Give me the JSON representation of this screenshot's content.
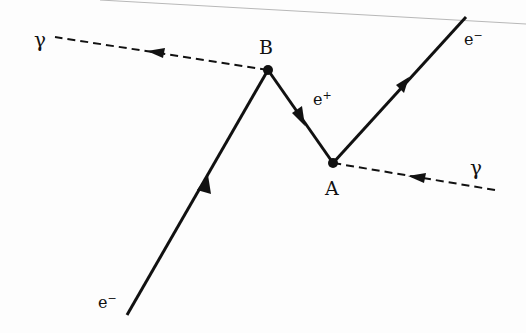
{
  "diagram": {
    "type": "feynman-diagram",
    "vertices": [
      {
        "id": "B",
        "label": "B",
        "x": 268,
        "y": 70
      },
      {
        "id": "A",
        "label": "A",
        "x": 333,
        "y": 163
      }
    ],
    "lines": [
      {
        "id": "photon-out",
        "kind": "photon",
        "from": [
          268,
          70
        ],
        "to": [
          55,
          37
        ],
        "label": "γ"
      },
      {
        "id": "electron-in",
        "kind": "fermion",
        "from": [
          127,
          315
        ],
        "to": [
          268,
          70
        ],
        "label": "e",
        "label_sup": "−"
      },
      {
        "id": "positron",
        "kind": "fermion",
        "from": [
          268,
          70
        ],
        "to": [
          333,
          163
        ],
        "label": "e",
        "label_sup": "+"
      },
      {
        "id": "electron-out",
        "kind": "fermion",
        "from": [
          333,
          163
        ],
        "to": [
          466,
          17
        ],
        "label": "e",
        "label_sup": "−"
      },
      {
        "id": "photon-in",
        "kind": "photon",
        "from": [
          495,
          190
        ],
        "to": [
          333,
          163
        ],
        "label": "γ"
      }
    ],
    "colors": {
      "line": "#111111",
      "border": "#b0b0b0"
    }
  },
  "labels": {
    "gamma_left": "γ",
    "gamma_right": "γ",
    "vertex_b": "B",
    "vertex_a": "A",
    "e_bottom": "e",
    "e_bottom_sup": "−",
    "e_plus": "e",
    "e_plus_sup": "+",
    "e_top": "e",
    "e_top_sup": "−"
  }
}
